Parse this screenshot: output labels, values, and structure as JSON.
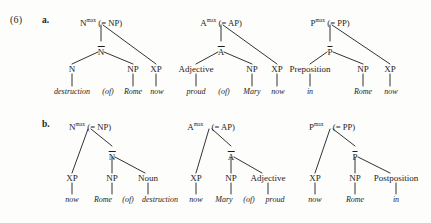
{
  "example": {
    "number": "(6)",
    "row_a_letter": "a.",
    "row_b_letter": "b."
  },
  "labels": {
    "eq_np": "(= NP)",
    "eq_ap": "(= AP)",
    "eq_pp": "(= PP)",
    "max": "max",
    "N": "N",
    "A": "A",
    "P": "P",
    "Nbar": "N",
    "Abar": "A",
    "Pbar": "P",
    "NP": "NP",
    "XP": "XP",
    "Noun": "Noun",
    "Adjective": "Adjective",
    "Preposition": "Preposition",
    "Postposition": "Postposition"
  },
  "trees": {
    "a_noun": {
      "root": "N",
      "root_eq": "(= NP)",
      "bar": "N",
      "children": [
        "N",
        "NP",
        "XP"
      ],
      "terminals": [
        "destruction",
        "(of)",
        "Rome",
        "now"
      ]
    },
    "a_adj": {
      "root": "A",
      "root_eq": "(= AP)",
      "bar": "A",
      "children": [
        "Adjective",
        "NP",
        "XP"
      ],
      "terminals": [
        "proud",
        "(of)",
        "Mary",
        "now"
      ]
    },
    "a_prep": {
      "root": "P",
      "root_eq": "(= PP)",
      "bar": "P",
      "children": [
        "Preposition",
        "NP",
        "XP"
      ],
      "terminals": [
        "in",
        "Rome",
        "now"
      ]
    },
    "b_noun": {
      "root": "N",
      "root_eq": "(= NP)",
      "bar": "N",
      "children": [
        "XP",
        "NP",
        "Noun"
      ],
      "terminals": [
        "now",
        "Rome",
        "(of)",
        "destruction"
      ]
    },
    "b_adj": {
      "root": "A",
      "root_eq": "(= AP)",
      "bar": "A",
      "children": [
        "XP",
        "NP",
        "Adjective"
      ],
      "terminals": [
        "now",
        "Mary",
        "(of)",
        "proud"
      ]
    },
    "b_post": {
      "root": "P",
      "root_eq": "(= PP)",
      "bar": "P",
      "children": [
        "XP",
        "NP",
        "Postposition"
      ],
      "terminals": [
        "now",
        "Rome",
        "in"
      ]
    }
  },
  "colors": {
    "ink": "#1c1c1c",
    "page": "#fdfdfc"
  }
}
